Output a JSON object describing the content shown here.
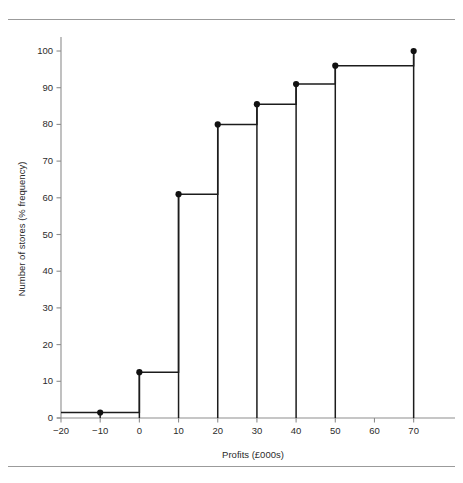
{
  "figure": {
    "top_rule": "horizontal-rule",
    "bottom_rule": "horizontal-rule"
  },
  "chart_data": {
    "type": "line",
    "subtype": "ogive-step-cumulative-frequency",
    "title": "",
    "subtitle": "",
    "xlabel": "Profits (£000s)",
    "ylabel": "Number of stores (% frequency)",
    "xlim": [
      -20,
      78
    ],
    "ylim": [
      0,
      103
    ],
    "xticks": [
      -20,
      -10,
      0,
      10,
      20,
      30,
      40,
      50,
      60,
      70
    ],
    "xtick_labels": [
      "−20",
      "−10",
      "0",
      "10",
      "20",
      "30",
      "40",
      "50",
      "60",
      "70"
    ],
    "yticks": [
      0,
      10,
      20,
      30,
      40,
      50,
      60,
      70,
      80,
      90,
      100
    ],
    "ytick_labels": [
      "0",
      "10",
      "20",
      "30",
      "40",
      "50",
      "60",
      "70",
      "80",
      "90",
      "100"
    ],
    "grid": false,
    "legend": null,
    "legend_position": "none",
    "series": [
      {
        "name": "Cumulative % frequency",
        "markers": true,
        "marker_shape": "circle",
        "step_mode": "pre",
        "x": [
          -20,
          -10,
          0,
          10,
          20,
          30,
          40,
          50,
          70
        ],
        "y": [
          1.5,
          1.5,
          12.5,
          61,
          80,
          85.5,
          91,
          96,
          100
        ],
        "points": [
          {
            "x": -10,
            "y": 1.5
          },
          {
            "x": 0,
            "y": 12.5
          },
          {
            "x": 10,
            "y": 61
          },
          {
            "x": 20,
            "y": 80
          },
          {
            "x": 30,
            "y": 85.5
          },
          {
            "x": 40,
            "y": 91
          },
          {
            "x": 50,
            "y": 96
          },
          {
            "x": 70,
            "y": 100
          }
        ]
      }
    ],
    "colors": {
      "line": "#1c1c1c",
      "marker": "#111111",
      "axis": "#8d8d8d",
      "text": "#2b2b2b",
      "background": "#ffffff",
      "rule": "#9b9b9b"
    }
  }
}
